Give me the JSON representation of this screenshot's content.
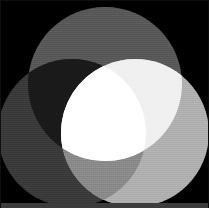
{
  "image": {
    "title": "Additive grayscale Venn diagram",
    "width": 209,
    "height": 208,
    "background_color": "#000000",
    "border_color": "#0d0d0d",
    "bottom_strip_color": "#3c3c3c",
    "bottom_strip_height": 5,
    "texture": "faint dither halftone grain"
  },
  "chart_data": {
    "type": "diagram",
    "subtype": "venn-3-circle-additive",
    "xlabel": "",
    "ylabel": "",
    "grid": false,
    "legend": "none",
    "canvas": {
      "width": 209,
      "height": 208,
      "background": "#000000"
    },
    "circles": [
      {
        "name": "top",
        "label": "Top circle",
        "cx": 105,
        "cy": 84,
        "r": 77,
        "color": "#585858",
        "value": 88
      },
      {
        "name": "left",
        "label": "Left circle",
        "cx": 72,
        "cy": 133,
        "r": 74,
        "color": "#3a3a3a",
        "value": 58
      },
      {
        "name": "right",
        "label": "Right circle",
        "cx": 135,
        "cy": 133,
        "r": 74,
        "color": "#b0b0b0",
        "value": 176
      }
    ],
    "regions": [
      {
        "name": "background",
        "members": [],
        "color": "#000000",
        "value": 0
      },
      {
        "name": "top-only",
        "members": [
          "top"
        ],
        "color": "#585858",
        "value": 88
      },
      {
        "name": "left-only",
        "members": [
          "left"
        ],
        "color": "#3a3a3a",
        "value": 58
      },
      {
        "name": "right-only",
        "members": [
          "right"
        ],
        "color": "#b0b0b0",
        "value": 176
      },
      {
        "name": "top-left",
        "members": [
          "top",
          "left"
        ],
        "color": "#1a1a1a",
        "value": 26
      },
      {
        "name": "top-right",
        "members": [
          "top",
          "right"
        ],
        "color": "#f0f0f0",
        "value": 240
      },
      {
        "name": "left-right",
        "members": [
          "left",
          "right"
        ],
        "color": "#8a8a8a",
        "value": 138
      },
      {
        "name": "top-left-right",
        "members": [
          "top",
          "left",
          "right"
        ],
        "color": "#ffffff",
        "value": 255
      }
    ],
    "categories": [
      "top-only",
      "left-only",
      "right-only",
      "top-left",
      "top-right",
      "left-right",
      "top-left-right"
    ],
    "values": [
      88,
      58,
      176,
      26,
      240,
      138,
      255
    ],
    "ylim": [
      0,
      255
    ]
  }
}
